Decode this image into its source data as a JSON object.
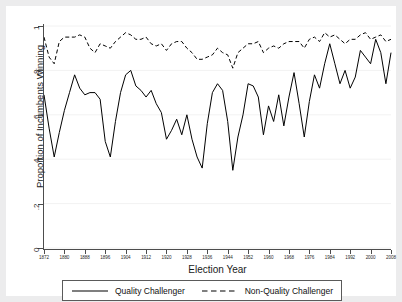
{
  "chart_data": {
    "type": "line",
    "title": "",
    "xlabel": "Election Year",
    "ylabel": "Proportion of Incumbents Winning",
    "xlim": [
      1872,
      2008
    ],
    "ylim": [
      0,
      1
    ],
    "grid": "horizontal",
    "legend_position": "bottom",
    "ytick_labels": [
      "0",
      ".2",
      ".4",
      ".6",
      ".8",
      "1"
    ],
    "ytick_values": [
      0,
      0.2,
      0.4,
      0.6,
      0.8,
      1
    ],
    "xtick_labels": [
      "1872",
      "1880",
      "1888",
      "1896",
      "1904",
      "1912",
      "1920",
      "1928",
      "1936",
      "1944",
      "1952",
      "1960",
      "1968",
      "1976",
      "1984",
      "1992",
      "2000",
      "2008"
    ],
    "xtick_values": [
      1872,
      1880,
      1888,
      1896,
      1904,
      1912,
      1920,
      1928,
      1936,
      1944,
      1952,
      1960,
      1968,
      1976,
      1984,
      1992,
      2000,
      2008
    ],
    "x": [
      1872,
      1874,
      1876,
      1878,
      1880,
      1882,
      1884,
      1886,
      1888,
      1890,
      1892,
      1894,
      1896,
      1898,
      1900,
      1902,
      1904,
      1906,
      1908,
      1910,
      1912,
      1914,
      1916,
      1918,
      1920,
      1922,
      1924,
      1926,
      1928,
      1930,
      1932,
      1934,
      1936,
      1938,
      1940,
      1942,
      1944,
      1946,
      1948,
      1950,
      1952,
      1954,
      1956,
      1958,
      1960,
      1962,
      1964,
      1966,
      1968,
      1970,
      1972,
      1974,
      1976,
      1978,
      1980,
      1982,
      1984,
      1986,
      1988,
      1990,
      1992,
      1994,
      1996,
      1998,
      2000,
      2002,
      2004,
      2006,
      2008
    ],
    "series": [
      {
        "name": "Quality Challenger",
        "style": "solid",
        "color": "#000000",
        "values": [
          0.69,
          0.54,
          0.41,
          0.52,
          0.62,
          0.7,
          0.78,
          0.72,
          0.69,
          0.7,
          0.7,
          0.67,
          0.48,
          0.41,
          0.57,
          0.7,
          0.78,
          0.8,
          0.73,
          0.71,
          0.68,
          0.71,
          0.65,
          0.61,
          0.49,
          0.53,
          0.58,
          0.51,
          0.6,
          0.49,
          0.41,
          0.36,
          0.56,
          0.7,
          0.74,
          0.71,
          0.57,
          0.35,
          0.5,
          0.6,
          0.74,
          0.73,
          0.68,
          0.51,
          0.64,
          0.57,
          0.69,
          0.55,
          0.68,
          0.79,
          0.65,
          0.5,
          0.66,
          0.78,
          0.72,
          0.83,
          0.92,
          0.83,
          0.74,
          0.8,
          0.72,
          0.77,
          0.89,
          0.86,
          0.83,
          0.94,
          0.88,
          0.74,
          0.88
        ]
      },
      {
        "name": "Non-Quality Challenger",
        "style": "dashed",
        "color": "#000000",
        "values": [
          0.95,
          0.86,
          0.83,
          0.93,
          0.95,
          0.95,
          0.95,
          0.96,
          0.95,
          0.9,
          0.88,
          0.92,
          0.91,
          0.9,
          0.93,
          0.95,
          0.97,
          0.96,
          0.94,
          0.94,
          0.95,
          0.92,
          0.91,
          0.92,
          0.89,
          0.92,
          0.93,
          0.93,
          0.9,
          0.88,
          0.85,
          0.85,
          0.86,
          0.87,
          0.9,
          0.88,
          0.87,
          0.81,
          0.88,
          0.9,
          0.92,
          0.92,
          0.93,
          0.88,
          0.9,
          0.91,
          0.9,
          0.92,
          0.93,
          0.93,
          0.93,
          0.9,
          0.94,
          0.95,
          0.93,
          0.97,
          0.95,
          0.96,
          0.94,
          0.92,
          0.94,
          0.94,
          0.96,
          0.97,
          0.94,
          0.95,
          0.96,
          0.93,
          0.94
        ]
      }
    ]
  },
  "legend": {
    "items": [
      {
        "label": "Quality Challenger",
        "style": "solid"
      },
      {
        "label": "Non-Quality Challenger",
        "style": "dashed"
      }
    ]
  }
}
